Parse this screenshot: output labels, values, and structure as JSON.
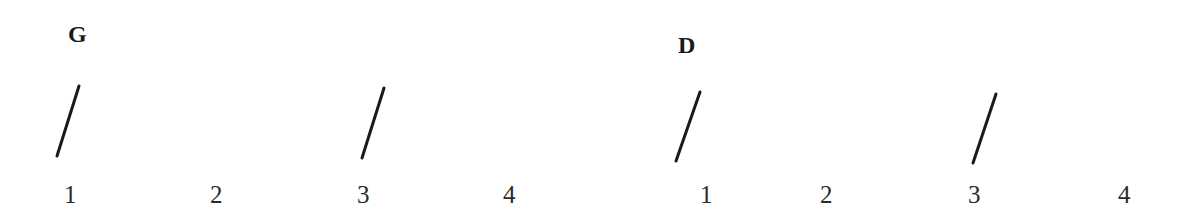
{
  "measures": [
    {
      "chord": "G",
      "chord_pos": {
        "x": 68,
        "y": 22
      },
      "beats": [
        {
          "label": "1",
          "x": 64
        },
        {
          "label": "2",
          "x": 210
        },
        {
          "label": "3",
          "x": 357
        },
        {
          "label": "4",
          "x": 503
        }
      ],
      "strums": [
        {
          "on_beat": "1",
          "x1": 79,
          "y1": 86,
          "x2": 57,
          "y2": 156
        },
        {
          "on_beat": "3",
          "x1": 384,
          "y1": 88,
          "x2": 362,
          "y2": 158
        }
      ]
    },
    {
      "chord": "D",
      "chord_pos": {
        "x": 678,
        "y": 33
      },
      "beats": [
        {
          "label": "1",
          "x": 700
        },
        {
          "label": "2",
          "x": 820
        },
        {
          "label": "3",
          "x": 968
        },
        {
          "label": "4",
          "x": 1118
        }
      ],
      "strums": [
        {
          "on_beat": "1",
          "x1": 700,
          "y1": 92,
          "x2": 676,
          "y2": 161
        },
        {
          "on_beat": "3",
          "x1": 996,
          "y1": 94,
          "x2": 973,
          "y2": 163
        }
      ]
    }
  ],
  "beat_row_y": 182,
  "colors": {
    "stroke": "#1a1a1a",
    "text": "#2a2a2a",
    "background": "#ffffff"
  }
}
